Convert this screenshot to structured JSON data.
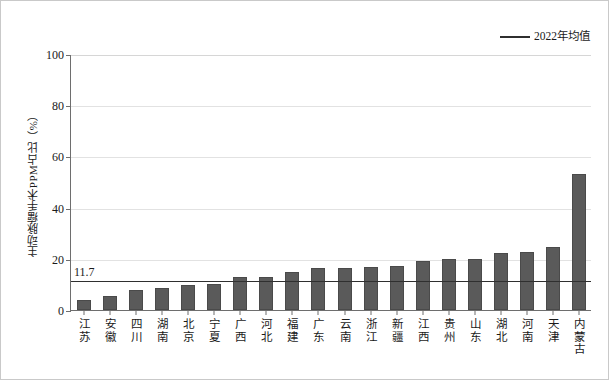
{
  "chart_data": {
    "type": "bar",
    "title": "",
    "xlabel": "",
    "ylabel": "主动脉瘤手术PPM占比（%）",
    "ylim": [
      0,
      100
    ],
    "yticks": [
      0,
      20,
      40,
      60,
      80,
      100
    ],
    "grid": true,
    "legend_position": "top-right",
    "legend": [
      {
        "name": "2022年均值",
        "type": "line",
        "color": "#2f2f2f"
      }
    ],
    "categories": [
      "江苏",
      "安徽",
      "四川",
      "湖南",
      "北京",
      "宁夏",
      "广西",
      "河北",
      "福建",
      "广东",
      "云南",
      "浙江",
      "新疆",
      "江西",
      "贵州",
      "山东",
      "湖北",
      "河南",
      "天津",
      "内蒙古"
    ],
    "values": [
      3.8,
      5.6,
      8.0,
      8.6,
      9.6,
      10.0,
      12.8,
      12.8,
      14.8,
      16.3,
      16.6,
      16.8,
      17.2,
      19.0,
      20.0,
      20.0,
      22.3,
      22.6,
      24.6,
      53.0
    ],
    "series": [
      {
        "name": "主动脉瘤手术PPM占比",
        "values": [
          3.8,
          5.6,
          8.0,
          8.6,
          9.6,
          10.0,
          12.8,
          12.8,
          14.8,
          16.3,
          16.6,
          16.8,
          17.2,
          19.0,
          20.0,
          20.0,
          22.3,
          22.6,
          24.6,
          53.0
        ],
        "color": "#5a5a5a"
      }
    ],
    "reference_line": {
      "label": "2022年均值",
      "value": 11.7,
      "value_label": "11.7",
      "color": "#2f2f2f"
    },
    "bar_color": "#5a5a5a",
    "axis_color": "#6e6e6e",
    "grid_color": "#e2e2e2"
  },
  "ytick_labels": [
    "0",
    "20",
    "40",
    "60",
    "80",
    "100"
  ],
  "legend_label": "2022年均值",
  "avg_value_label": "11.7"
}
